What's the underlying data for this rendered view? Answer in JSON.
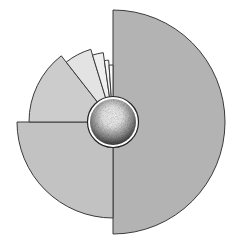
{
  "diagram": {
    "type": "polar-area-nautilus",
    "center": [
      113,
      122
    ],
    "stroke": "#3a3a3a",
    "segments": [
      {
        "name": "segment-1",
        "start_deg": -90,
        "end_deg": 90,
        "radius": 112,
        "fill": "#b3b3b3"
      },
      {
        "name": "segment-2",
        "start_deg": 90,
        "end_deg": 180,
        "radius": 96,
        "fill": "#c2c2c2"
      },
      {
        "name": "segment-3",
        "start_deg": 180,
        "end_deg": 232,
        "radius": 84,
        "fill": "#cccccc"
      },
      {
        "name": "segment-4",
        "start_deg": 232,
        "end_deg": 253,
        "radius": 76,
        "fill": "#e3e3e3"
      },
      {
        "name": "segment-5",
        "start_deg": 253,
        "end_deg": 262,
        "radius": 70,
        "fill": "#efefef"
      },
      {
        "name": "segment-6",
        "start_deg": 262,
        "end_deg": 266,
        "radius": 62,
        "fill": "#f5f5f5"
      },
      {
        "name": "segment-7",
        "start_deg": 266,
        "end_deg": 270,
        "radius": 57,
        "fill": "#fafafa"
      }
    ],
    "hub": {
      "radius": 24,
      "highlight": "#ffffff",
      "shadow": "#4a4a4a",
      "ring": "#ffffff"
    }
  }
}
